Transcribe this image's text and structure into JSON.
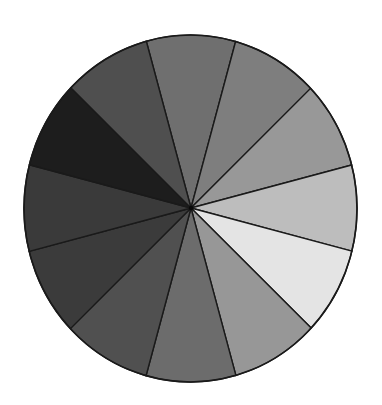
{
  "figure": {
    "kind": "gray-value wheel",
    "segment_count": 12,
    "equal_segments": true,
    "start_angle_deg": -15,
    "direction": "clockwise from top",
    "outline_color": "#1a1a1a",
    "background": "#ffffff",
    "segments": [
      {
        "position": "top",
        "center_angle_deg": 0,
        "fill": "#6f6f6f"
      },
      {
        "position": "upper-right",
        "center_angle_deg": 30,
        "fill": "#7e7e7e"
      },
      {
        "position": "right-upper",
        "center_angle_deg": 60,
        "fill": "#989898"
      },
      {
        "position": "right",
        "center_angle_deg": 90,
        "fill": "#bdbdbd"
      },
      {
        "position": "right-lower",
        "center_angle_deg": 120,
        "fill": "#e4e4e4"
      },
      {
        "position": "lower-right",
        "center_angle_deg": 150,
        "fill": "#979797"
      },
      {
        "position": "bottom",
        "center_angle_deg": 180,
        "fill": "#6c6c6c"
      },
      {
        "position": "lower-left",
        "center_angle_deg": 210,
        "fill": "#505050"
      },
      {
        "position": "left-lower",
        "center_angle_deg": 240,
        "fill": "#3b3b3b"
      },
      {
        "position": "left",
        "center_angle_deg": 270,
        "fill": "#3a3a3a"
      },
      {
        "position": "left-upper",
        "center_angle_deg": 300,
        "fill": "#1d1d1d"
      },
      {
        "position": "upper-left",
        "center_angle_deg": 330,
        "fill": "#4f4f4f"
      }
    ]
  }
}
